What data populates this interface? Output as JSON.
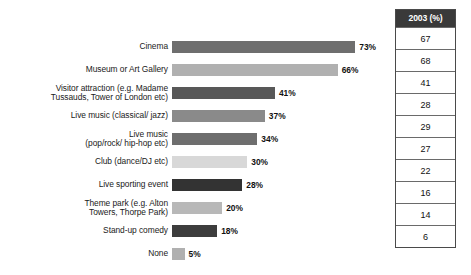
{
  "chart_data": {
    "type": "bar",
    "title": "",
    "subtitle": "",
    "xlabel": "",
    "ylabel": "",
    "orientation": "horizontal",
    "grid": false,
    "legend": "none",
    "xlim": [
      0,
      80
    ],
    "categories": [
      "Cinema",
      "Museum or Art Gallery",
      "Visitor attraction (e.g. Madame\nTussauds, Tower of London etc)",
      "Live music (classical/ jazz)",
      "Live music\n(pop/rock/ hip-hop etc)",
      "Club (dance/DJ etc)",
      "Live sporting event",
      "Theme park (e.g. Alton\nTowers, Thorpe Park)",
      "Stand-up comedy",
      "None"
    ],
    "values": [
      73,
      66,
      41,
      37,
      34,
      30,
      28,
      20,
      18,
      5
    ],
    "value_labels": [
      "73%",
      "66%",
      "41%",
      "37%",
      "34%",
      "30%",
      "28%",
      "20%",
      "18%",
      "5%"
    ],
    "bar_colors": [
      "#6e6e6e",
      "#b0b0b0",
      "#585858",
      "#8a8a8a",
      "#6e6e6e",
      "#d8d8d8",
      "#333333",
      "#b8b8b8",
      "#3d3d3d",
      "#b0b0b0"
    ]
  },
  "table": {
    "header": "2003 (%)",
    "header_bg": "#3a3a3a",
    "header_color": "#ffffff",
    "values": [
      "67",
      "68",
      "41",
      "28",
      "29",
      "27",
      "22",
      "16",
      "14",
      "6"
    ]
  }
}
